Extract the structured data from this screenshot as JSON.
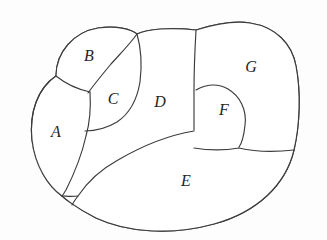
{
  "figure": {
    "name": "partitioned-region-diagram",
    "kind": "planar-region-partition",
    "background_color": "#fdfdfd",
    "stroke_color": "#3b3b3b",
    "fill_color": "#ffffff",
    "region_count": 7
  },
  "regions": [
    {
      "id": "A",
      "label": "A",
      "label_x": 56,
      "label_y": 133,
      "description": "left region"
    },
    {
      "id": "B",
      "label": "B",
      "label_x": 89,
      "label_y": 57,
      "description": "upper left region"
    },
    {
      "id": "C",
      "label": "C",
      "label_x": 113,
      "label_y": 100,
      "description": "narrow crescent region between B and D"
    },
    {
      "id": "D",
      "label": "D",
      "label_x": 160,
      "label_y": 103,
      "description": "central region"
    },
    {
      "id": "E",
      "label": "E",
      "label_x": 186,
      "label_y": 182,
      "description": "large lower crescent region"
    },
    {
      "id": "F",
      "label": "F",
      "label_x": 224,
      "label_y": 111,
      "description": "small blob region inside right lobe"
    },
    {
      "id": "G",
      "label": "G",
      "label_x": 251,
      "label_y": 68,
      "description": "upper right region"
    }
  ]
}
